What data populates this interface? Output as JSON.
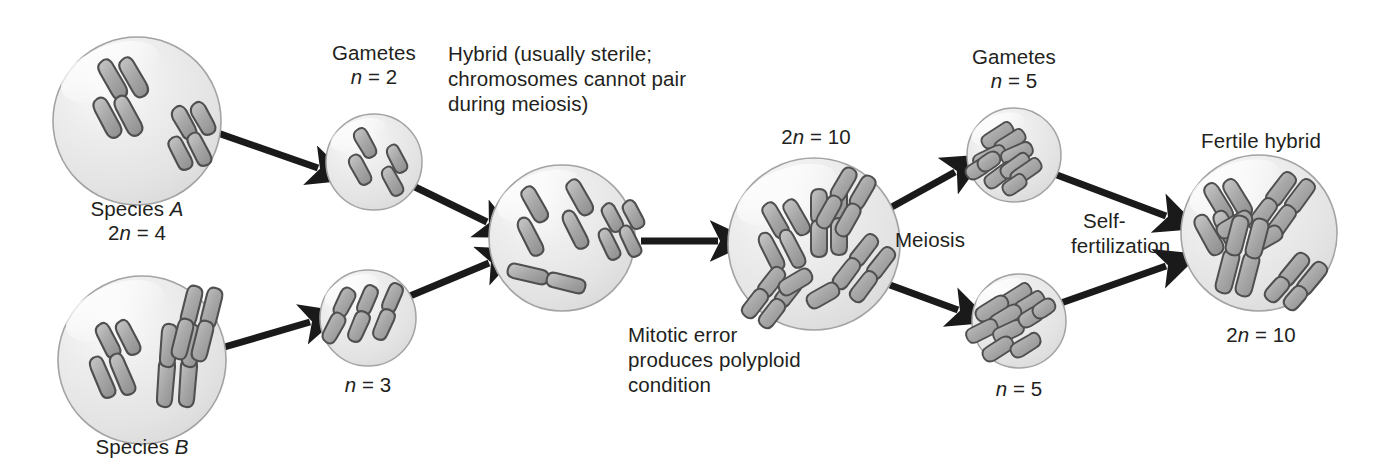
{
  "diagram": {
    "type": "biology-process-diagram",
    "background_color": "#ffffff",
    "text_color": "#231f20",
    "cell_fill_color": "#e8e8e8",
    "cell_stroke_color": "#9a9a9a",
    "chromosome_fill_color": "#a6a6a6",
    "chromosome_stroke_color": "#4d4d4d",
    "arrow_color": "#1a1a1a"
  },
  "labels": {
    "species_a_name": "Species ",
    "species_a_italic": "A",
    "species_a_count_pre": "2",
    "species_a_count_n": "n",
    "species_a_count_post": " = 4",
    "species_b_name": "Species ",
    "species_b_italic": "B",
    "gametes_a_title": "Gametes",
    "gametes_a_n": "n",
    "gametes_a_value": " = 2",
    "gametes_b_n": "n",
    "gametes_b_value": " = 3",
    "hybrid_line1": "Hybrid (usually sterile;",
    "hybrid_line2": "chromosomes cannot pair",
    "hybrid_line3": "during meiosis)",
    "mitotic_line1": "Mitotic error",
    "mitotic_line2": "produces polyploid",
    "mitotic_line3": "condition",
    "polyploid_pre": "2",
    "polyploid_n": "n",
    "polyploid_post": " = 10",
    "meiosis": "Meiosis",
    "gametes_top_title": "Gametes",
    "gametes_top_n": "n",
    "gametes_top_value": " = 5",
    "gametes_bottom_n": "n",
    "gametes_bottom_value": " = 5",
    "self_fert_line1": "Self-",
    "self_fert_line2": "fertilization",
    "fertile_hybrid": "Fertile hybrid",
    "fertile_pre": "2",
    "fertile_n": "n",
    "fertile_post": " = 10"
  },
  "cells": [
    {
      "name": "species-a-cell",
      "cx": 137,
      "cy": 121,
      "r": 84,
      "chromosome_count": 4,
      "ploidy": "2n = 4"
    },
    {
      "name": "gametes-a-cell",
      "cx": 374,
      "cy": 162,
      "r": 48,
      "chromosome_count": 2,
      "ploidy": "n = 2"
    },
    {
      "name": "species-b-cell",
      "cx": 142,
      "cy": 360,
      "r": 84,
      "chromosome_count": 6,
      "ploidy": "2n = 6"
    },
    {
      "name": "gametes-b-cell",
      "cx": 368,
      "cy": 318,
      "r": 48,
      "chromosome_count": 3,
      "ploidy": "n = 3"
    },
    {
      "name": "sterile-hybrid-cell",
      "cx": 562,
      "cy": 238,
      "r": 73,
      "chromosome_count": 5,
      "ploidy": "n = 5"
    },
    {
      "name": "polyploid-cell",
      "cx": 814,
      "cy": 244,
      "r": 86,
      "chromosome_count": 10,
      "ploidy": "2n = 10"
    },
    {
      "name": "gametes-top-cell",
      "cx": 1014,
      "cy": 155,
      "r": 47,
      "chromosome_count": 5,
      "ploidy": "n = 5"
    },
    {
      "name": "gametes-bottom-cell",
      "cx": 1019,
      "cy": 321,
      "r": 47,
      "chromosome_count": 5,
      "ploidy": "n = 5"
    },
    {
      "name": "fertile-hybrid-cell",
      "cx": 1259,
      "cy": 233,
      "r": 78,
      "chromosome_count": 10,
      "ploidy": "2n = 10"
    }
  ],
  "arrows": [
    {
      "name": "arrow-species-a-to-gametes-a",
      "from": "species-a-cell",
      "to": "gametes-a-cell"
    },
    {
      "name": "arrow-species-b-to-gametes-b",
      "from": "species-b-cell",
      "to": "gametes-b-cell"
    },
    {
      "name": "arrow-gametes-a-to-hybrid",
      "from": "gametes-a-cell",
      "to": "sterile-hybrid-cell"
    },
    {
      "name": "arrow-gametes-b-to-hybrid",
      "from": "gametes-b-cell",
      "to": "sterile-hybrid-cell"
    },
    {
      "name": "arrow-hybrid-to-polyploid",
      "from": "sterile-hybrid-cell",
      "to": "polyploid-cell"
    },
    {
      "name": "arrow-polyploid-to-gametes-top",
      "from": "polyploid-cell",
      "to": "gametes-top-cell"
    },
    {
      "name": "arrow-polyploid-to-gametes-bottom",
      "from": "polyploid-cell",
      "to": "gametes-bottom-cell"
    },
    {
      "name": "arrow-gametes-top-to-fertile",
      "from": "gametes-top-cell",
      "to": "fertile-hybrid-cell"
    },
    {
      "name": "arrow-gametes-bottom-to-fertile",
      "from": "gametes-bottom-cell",
      "to": "fertile-hybrid-cell"
    }
  ]
}
